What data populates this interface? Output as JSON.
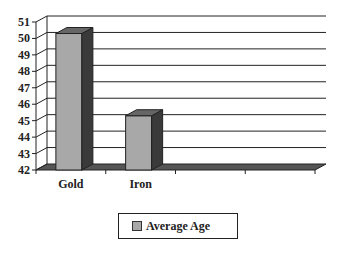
{
  "chart_data": {
    "type": "bar",
    "title": "",
    "xlabel": "",
    "ylabel": "",
    "categories": [
      "Gold",
      "Iron",
      "",
      ""
    ],
    "series": [
      {
        "name": "Average Age",
        "values": [
          50.3,
          45.3,
          null,
          null
        ],
        "color": "#a8a8a8"
      }
    ],
    "ylim": [
      42,
      51
    ],
    "yticks": [
      42,
      43,
      44,
      45,
      46,
      47,
      48,
      49,
      50,
      51
    ],
    "grid": true,
    "legend": "bottom-center",
    "style": "3d-column"
  },
  "legend": {
    "label": "Average Age"
  }
}
